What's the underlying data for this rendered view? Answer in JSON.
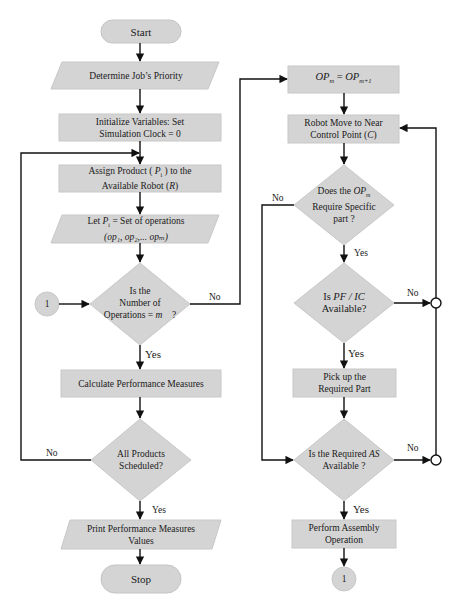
{
  "colors": {
    "shape_fill": "#d4d4d4",
    "shape_stroke": "#c8c8c8",
    "line": "#111111",
    "background": "#ffffff"
  },
  "left_column": {
    "start": {
      "shape": "terminator",
      "label": "Start"
    },
    "determine_priority": {
      "shape": "parallelogram",
      "label": "Determine Job’s Priority"
    },
    "initialize": {
      "shape": "process",
      "line1": "Initialize Variables: Set",
      "line2": "Simulation Clock = 0"
    },
    "assign_product": {
      "shape": "process",
      "line1_pre": "Assign Product ( ",
      "line1_var": "P",
      "line1_sub": "i",
      "line1_post": " ) to the",
      "line2_pre": "Available Robot (",
      "line2_var": "R",
      "line2_post": ")"
    },
    "let_pi": {
      "shape": "parallelogram",
      "line1_pre": "Let ",
      "line1_var": "P",
      "line1_sub": "i",
      "line1_post": " = Set of operations",
      "line2": "(op₁, op₂,... opₘ)"
    },
    "number_of_operations": {
      "shape": "decision",
      "line1": "Is the",
      "line2": "Number of",
      "line3_pre": "Operations = ",
      "line3_var": "m",
      "line3_post": "    ?"
    },
    "connector_in": {
      "shape": "connector",
      "label": "1"
    },
    "calculate": {
      "shape": "process",
      "label": "Calculate Performance Measures"
    },
    "all_scheduled": {
      "shape": "decision",
      "line1": "All Products",
      "line2": "Scheduled?"
    },
    "print": {
      "shape": "parallelogram",
      "line1": "Print Performance Measures",
      "line2": "Values"
    },
    "stop": {
      "shape": "terminator",
      "label": "Stop"
    }
  },
  "right_column": {
    "op_update": {
      "shape": "process",
      "var1": "OP",
      "sub1": "m",
      "eq": " = ",
      "var2": "OP",
      "sub2": "m+1"
    },
    "robot_move": {
      "shape": "process",
      "line1": "Robot Move to Near",
      "line2_pre": "Control Point (",
      "line2_var": "C",
      "line2_post": ")"
    },
    "require_part": {
      "shape": "decision",
      "line1_pre": "Does the ",
      "line1_var": "OP",
      "line1_sub": "m",
      "line2": "Require Specific",
      "line3": "part ?"
    },
    "pf_ic": {
      "shape": "decision",
      "line1_pre": "Is ",
      "line1_var": "PF / IC",
      "line2": "Available?"
    },
    "pick_up": {
      "shape": "process",
      "line1": "Pick up the",
      "line2": "Required Part"
    },
    "as_available": {
      "shape": "decision",
      "line1_pre": "Is the Required ",
      "line1_var": "AS",
      "line2": "Available ?"
    },
    "assembly": {
      "shape": "process",
      "line1": "Perform Assembly",
      "line2": "Operation"
    },
    "connector_out": {
      "shape": "connector",
      "label": "1"
    }
  },
  "branch_labels": {
    "ops_no": "No",
    "ops_yes": "Yes",
    "scheduled_no": "No",
    "scheduled_yes": "Yes",
    "require_no": "No",
    "require_yes": "Yes",
    "pfic_no": "No",
    "pfic_yes": "Yes",
    "as_no": "No",
    "as_yes": "Yes"
  }
}
